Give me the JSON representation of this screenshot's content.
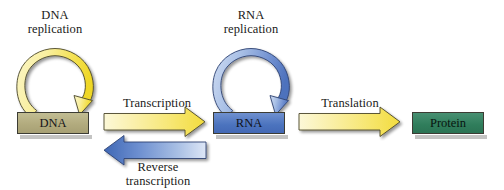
{
  "diagram": {
    "background_color": "#ffffff",
    "width": 504,
    "height": 190
  },
  "nodes": [
    {
      "id": "dna",
      "label": "DNA",
      "fill_color": "#b2ab7e",
      "border_color": "#3c3c34"
    },
    {
      "id": "rna",
      "label": "RNA",
      "fill_color": "#4b73be",
      "border_color": "#3c3c34"
    },
    {
      "id": "protein",
      "label": "Protein",
      "fill_color": "#2f7d5b",
      "border_color": "#3c3c34"
    }
  ],
  "cycles": [
    {
      "id": "dna-replication",
      "label_line1": "DNA",
      "label_line2": "replication",
      "color": "#f3e04a",
      "target": "dna"
    },
    {
      "id": "rna-replication",
      "label_line1": "RNA",
      "label_line2": "replication",
      "color": "#6f8fd0",
      "target": "rna"
    }
  ],
  "arrows": [
    {
      "id": "transcription",
      "label_line1": "Transcription",
      "label_line2": "",
      "direction": "right",
      "from": "dna",
      "to": "rna",
      "color": "#f5e96b",
      "label_position": "above"
    },
    {
      "id": "reverse-transcription",
      "label_line1": "Reverse",
      "label_line2": "transcription",
      "direction": "left",
      "from": "rna",
      "to": "dna",
      "color": "#4a72be",
      "label_position": "below"
    },
    {
      "id": "translation",
      "label_line1": "Translation",
      "label_line2": "",
      "direction": "right",
      "from": "rna",
      "to": "protein",
      "color": "#f5e96b",
      "label_position": "above"
    }
  ]
}
